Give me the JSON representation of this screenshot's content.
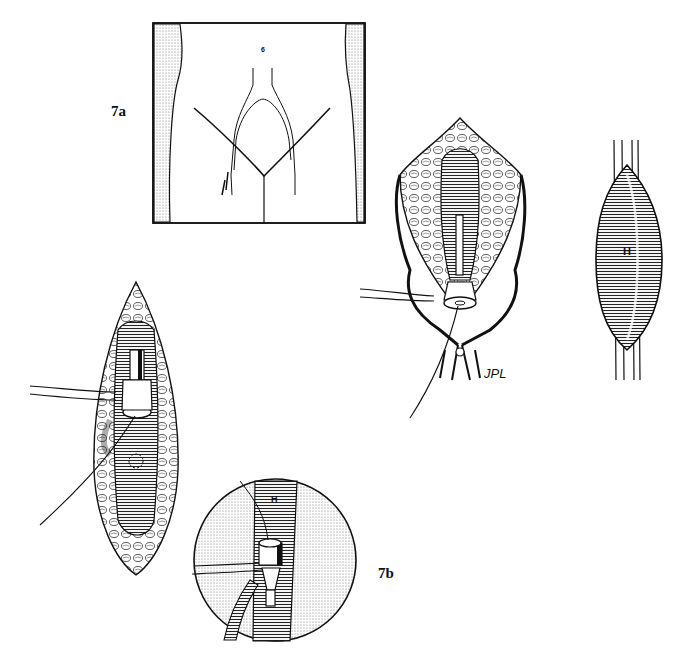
{
  "figure": {
    "labels": {
      "fig_7a": "7a",
      "fig_7b": "7b",
      "artist_signature": "JPL",
      "umbilicus_mark": "6",
      "aneurysm_mark": "H"
    },
    "colors": {
      "ink": "#111111",
      "paper": "#ffffff",
      "stipple": "#9a9a9a"
    },
    "panels": [
      {
        "id": "7a-torso",
        "description": "Front view of lower abdomen with inguinal incision lines"
      },
      {
        "id": "7-retractor",
        "description": "Open incision held by retractor with catheter inserted into vessel"
      },
      {
        "id": "7-aneurysm",
        "description": "Isolated fusiform aneurysm of vessel"
      },
      {
        "id": "7-open-incision",
        "description": "Elongated incision exposing vessel with catheter and suture"
      },
      {
        "id": "7b-inset",
        "description": "Circular magnified inset of catheter cannulation"
      }
    ]
  }
}
